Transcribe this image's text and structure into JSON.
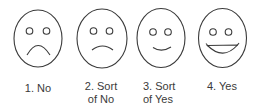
{
  "scale": {
    "stroke_color": "#3a3a3a",
    "items": [
      {
        "number": "1.",
        "line1": "1. No",
        "line2": "",
        "expression": "frown-strong-icon"
      },
      {
        "number": "2.",
        "line1": "2. Sort",
        "line2": "of No",
        "expression": "frown-slight-icon"
      },
      {
        "number": "3.",
        "line1": "3. Sort",
        "line2": "of Yes",
        "expression": "smile-slight-icon"
      },
      {
        "number": "4.",
        "line1": "4. Yes",
        "line2": "",
        "expression": "smile-big-icon"
      }
    ]
  }
}
